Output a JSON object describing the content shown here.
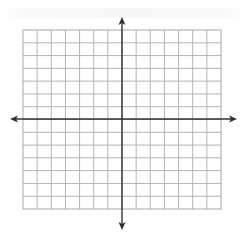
{
  "diagram": {
    "type": "coordinate-plane",
    "grid": {
      "columns": 14,
      "rows": 14,
      "left": 23,
      "top": 30,
      "right": 221,
      "bottom": 209,
      "line_color": "#b4b4b4",
      "border_color": "#a8a8a8"
    },
    "axes": {
      "color": "#303030",
      "x_axis": {
        "y": 119,
        "x_start": 10,
        "x_end": 237
      },
      "y_axis": {
        "x": 122,
        "y_start": 17,
        "y_end": 230
      }
    },
    "labels": {
      "x_axis_label": "",
      "y_axis_label": ""
    }
  }
}
